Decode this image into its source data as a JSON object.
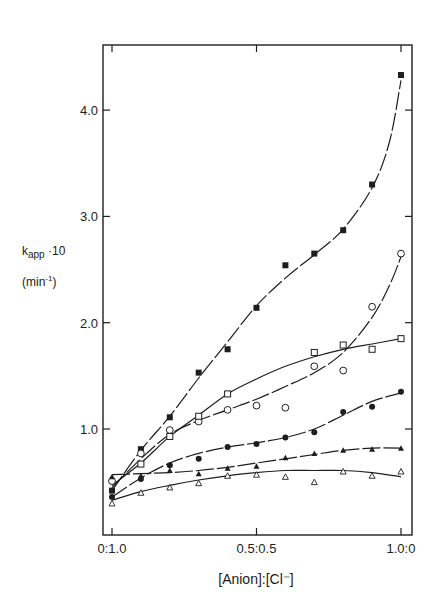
{
  "chart_data": {
    "type": "line",
    "title": "",
    "xlabel": "[Anion]:[Cl⁻]",
    "ylabel": "k_app · 10 (min⁻¹)",
    "ylabel_parts": {
      "main": "k",
      "sub": "app",
      "tail": " ·10",
      "unit_open": "(min",
      "unit_sup": "-1",
      "unit_close": ")"
    },
    "x_ticks": [
      {
        "value": 0.0,
        "label": "0:1.0"
      },
      {
        "value": 0.5,
        "label": "0.5:0.5"
      },
      {
        "value": 1.0,
        "label": "1.0:0"
      }
    ],
    "y_ticks": [
      {
        "value": 1.0,
        "label": "1.0"
      },
      {
        "value": 2.0,
        "label": "2.0"
      },
      {
        "value": 3.0,
        "label": "3.0"
      },
      {
        "value": 4.0,
        "label": "4.0"
      }
    ],
    "xlim": [
      -0.03,
      1.04
    ],
    "ylim": [
      0,
      4.6
    ],
    "grid": false,
    "legend": "none",
    "x": [
      0.0,
      0.1,
      0.2,
      0.3,
      0.4,
      0.5,
      0.6,
      0.7,
      0.8,
      0.9,
      1.0
    ],
    "series": [
      {
        "name": "filled-square",
        "marker": "filled-square",
        "values": [
          0.42,
          0.81,
          1.11,
          1.53,
          1.75,
          2.14,
          2.54,
          2.65,
          2.87,
          3.3,
          4.33
        ]
      },
      {
        "name": "open-circle",
        "marker": "open-circle",
        "values": [
          0.51,
          0.77,
          0.99,
          1.07,
          1.18,
          1.22,
          1.2,
          1.59,
          1.55,
          2.15,
          2.65
        ]
      },
      {
        "name": "open-square",
        "marker": "open-square",
        "values": [
          null,
          0.67,
          0.93,
          1.12,
          1.33,
          null,
          null,
          1.72,
          1.79,
          1.75,
          1.85
        ]
      },
      {
        "name": "filled-circle",
        "marker": "filled-circle",
        "values": [
          0.36,
          0.53,
          0.66,
          0.72,
          0.83,
          0.86,
          0.92,
          0.97,
          1.16,
          1.21,
          1.35
        ]
      },
      {
        "name": "filled-triangle",
        "marker": "filled-triangle",
        "values": [
          0.55,
          0.56,
          0.61,
          0.58,
          0.63,
          0.65,
          0.73,
          0.77,
          0.8,
          0.81,
          0.82
        ]
      },
      {
        "name": "open-triangle",
        "marker": "open-triangle",
        "values": [
          0.3,
          0.4,
          0.45,
          0.49,
          0.56,
          0.57,
          0.55,
          0.5,
          0.6,
          0.56,
          0.6
        ]
      }
    ],
    "fit_curves": [
      {
        "series": "filled-square",
        "points": [
          [
            0.0,
            0.42
          ],
          [
            0.1,
            0.8
          ],
          [
            0.2,
            1.12
          ],
          [
            0.3,
            1.48
          ],
          [
            0.4,
            1.82
          ],
          [
            0.5,
            2.16
          ],
          [
            0.6,
            2.42
          ],
          [
            0.7,
            2.64
          ],
          [
            0.8,
            2.88
          ],
          [
            0.9,
            3.27
          ],
          [
            0.96,
            3.7
          ],
          [
            1.0,
            4.28
          ]
        ]
      },
      {
        "series": "open-circle",
        "points": [
          [
            0.0,
            0.45
          ],
          [
            0.1,
            0.72
          ],
          [
            0.2,
            0.95
          ],
          [
            0.3,
            1.08
          ],
          [
            0.4,
            1.18
          ],
          [
            0.5,
            1.28
          ],
          [
            0.6,
            1.4
          ],
          [
            0.7,
            1.53
          ],
          [
            0.8,
            1.72
          ],
          [
            0.9,
            2.05
          ],
          [
            0.96,
            2.35
          ],
          [
            1.0,
            2.62
          ]
        ]
      },
      {
        "series": "open-square",
        "points": [
          [
            0.0,
            0.47
          ],
          [
            0.1,
            0.68
          ],
          [
            0.2,
            0.93
          ],
          [
            0.3,
            1.13
          ],
          [
            0.4,
            1.33
          ],
          [
            0.5,
            1.47
          ],
          [
            0.6,
            1.59
          ],
          [
            0.7,
            1.68
          ],
          [
            0.8,
            1.75
          ],
          [
            0.9,
            1.8
          ],
          [
            1.0,
            1.85
          ]
        ]
      },
      {
        "series": "filled-circle",
        "points": [
          [
            0.0,
            0.36
          ],
          [
            0.1,
            0.54
          ],
          [
            0.2,
            0.68
          ],
          [
            0.3,
            0.77
          ],
          [
            0.4,
            0.83
          ],
          [
            0.5,
            0.87
          ],
          [
            0.6,
            0.92
          ],
          [
            0.7,
            1.0
          ],
          [
            0.8,
            1.13
          ],
          [
            0.9,
            1.26
          ],
          [
            1.0,
            1.34
          ]
        ]
      },
      {
        "series": "filled-triangle",
        "points": [
          [
            0.0,
            0.57
          ],
          [
            0.1,
            0.58
          ],
          [
            0.2,
            0.59
          ],
          [
            0.3,
            0.61
          ],
          [
            0.4,
            0.64
          ],
          [
            0.5,
            0.68
          ],
          [
            0.6,
            0.72
          ],
          [
            0.7,
            0.76
          ],
          [
            0.8,
            0.8
          ],
          [
            0.9,
            0.82
          ],
          [
            1.0,
            0.82
          ]
        ]
      },
      {
        "series": "open-triangle",
        "points": [
          [
            0.0,
            0.33
          ],
          [
            0.1,
            0.41
          ],
          [
            0.2,
            0.47
          ],
          [
            0.3,
            0.52
          ],
          [
            0.4,
            0.56
          ],
          [
            0.5,
            0.59
          ],
          [
            0.6,
            0.61
          ],
          [
            0.7,
            0.61
          ],
          [
            0.8,
            0.61
          ],
          [
            0.9,
            0.59
          ],
          [
            1.0,
            0.55
          ]
        ]
      }
    ]
  }
}
